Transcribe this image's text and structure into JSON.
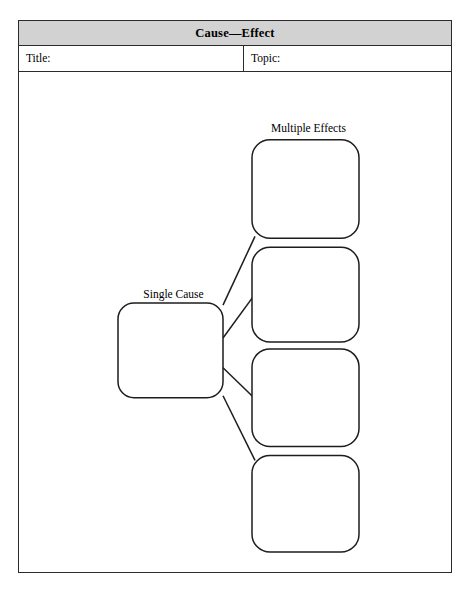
{
  "page": {
    "background_color": "#ffffff",
    "frame_border_color": "#2b2b2b",
    "ink_color": "#1d1d1d"
  },
  "header": {
    "title": "Cause—Effect",
    "background_color": "#d2d2d2"
  },
  "fields": {
    "title_label": "Title:",
    "title_value": "",
    "topic_label": "Topic:",
    "topic_value": ""
  },
  "diagram": {
    "type": "cause-effect-graphic-organizer",
    "cause_label": "Single Cause",
    "effects_label": "Multiple Effects",
    "cause_box": {
      "text": "",
      "x": 99,
      "y": 232,
      "width": 105,
      "height": 95,
      "corner_radius": 16
    },
    "effect_boxes": [
      {
        "text": "",
        "x": 233,
        "y": 68,
        "width": 107,
        "height": 99,
        "corner_radius": 18
      },
      {
        "text": "",
        "x": 233,
        "y": 176,
        "width": 107,
        "height": 95,
        "corner_radius": 18
      },
      {
        "text": "",
        "x": 233,
        "y": 278,
        "width": 107,
        "height": 98,
        "corner_radius": 18
      },
      {
        "text": "",
        "x": 233,
        "y": 385,
        "width": 107,
        "height": 97,
        "corner_radius": 18
      }
    ],
    "connectors": [
      {
        "from_x": 204,
        "from_y": 234,
        "to_x": 236,
        "to_y": 165
      },
      {
        "from_x": 204,
        "from_y": 267,
        "to_x": 236,
        "to_y": 223
      },
      {
        "from_x": 204,
        "from_y": 297,
        "to_x": 236,
        "to_y": 328
      },
      {
        "from_x": 204,
        "from_y": 325,
        "to_x": 236,
        "to_y": 390
      }
    ]
  }
}
